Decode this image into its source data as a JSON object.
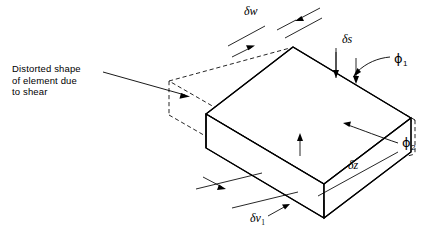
{
  "figure": {
    "type": "engineering-diagram",
    "background_color": "#ffffff",
    "line_color": "#000000"
  },
  "annotation": {
    "line1": "Distorted shape",
    "line2": "of element due",
    "line3": "to shear"
  },
  "labels": {
    "delta_w": "δw",
    "delta_s": "δs",
    "delta_z": "δz",
    "delta_v": "δv",
    "delta_v_sub": "1",
    "phi_1": "ϕ",
    "phi_1_sub": "1",
    "phi_2": "ϕ",
    "phi_2_sub": "2"
  }
}
